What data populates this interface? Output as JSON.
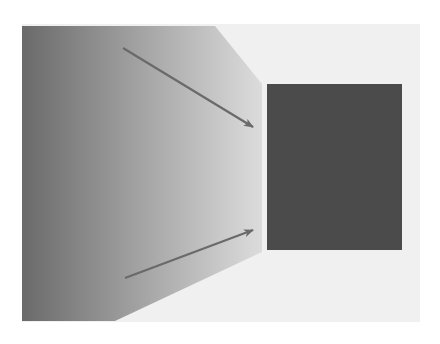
{
  "diagram": {
    "width": 440,
    "height": 344,
    "background_panel": {
      "x": 22,
      "y": 24,
      "width": 398,
      "height": 298,
      "color": "#f0f0f0"
    },
    "source_shape": {
      "kind": "gradient-trapezoid",
      "points": "22,26 215,26 262,84 262,252 115,321 22,321",
      "gradient_start": "#6a6a6a",
      "gradient_mid": "#a4a4a4",
      "gradient_end": "#dcdcdc"
    },
    "target_rect": {
      "x": 267,
      "y": 84,
      "width": 135,
      "height": 166,
      "color": "#4b4b4b"
    },
    "arrows": [
      {
        "name": "top-arrow",
        "x1": 123,
        "y1": 48,
        "x2": 253,
        "y2": 127,
        "color": "#6a6a6a"
      },
      {
        "name": "bottom-arrow",
        "x1": 125,
        "y1": 278,
        "x2": 253,
        "y2": 230,
        "color": "#6a6a6a"
      }
    ]
  }
}
